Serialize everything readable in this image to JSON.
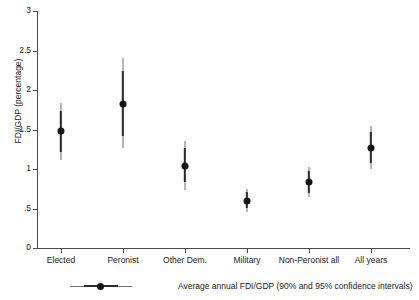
{
  "chart_data": {
    "type": "scatter",
    "title": "",
    "subtitle": "",
    "xlabel": "",
    "ylabel": "FDI/GDP (percentage)",
    "ylim": [
      0,
      3
    ],
    "yticks": [
      0,
      0.5,
      1,
      1.5,
      2,
      2.5,
      3
    ],
    "ytick_labels": [
      "0",
      ".5",
      "1",
      "1.5",
      "2",
      "2.5",
      "3"
    ],
    "grid": false,
    "legend_position": "below-axis",
    "legend_entries": [
      "Average annual FDI/GDP (90% and 95% confidence intervals)"
    ],
    "categories": [
      "Elected",
      "Peronist",
      "Other Dem.",
      "Military",
      "Non-Peronist all",
      "All years"
    ],
    "values": [
      1.48,
      1.82,
      1.04,
      0.6,
      0.83,
      1.27
    ],
    "ci90_low": [
      1.22,
      1.42,
      0.83,
      0.5,
      0.7,
      1.08
    ],
    "ci90_high": [
      1.74,
      2.24,
      1.27,
      0.71,
      0.97,
      1.47
    ],
    "ci95_low": [
      1.12,
      1.26,
      0.74,
      0.46,
      0.64,
      1.0
    ],
    "ci95_high": [
      1.83,
      2.4,
      1.36,
      0.75,
      1.03,
      1.54
    ],
    "series": [
      {
        "name": "Average annual FDI/GDP",
        "values": [
          1.48,
          1.82,
          1.04,
          0.6,
          0.83,
          1.27
        ]
      }
    ],
    "marker_color": "#141414",
    "ci90_color": "#2b2b2b",
    "ci95_color": "#6f6f6f",
    "axis_color": "#4a4a4a",
    "background_color": "#ffffff"
  },
  "legend": {
    "label": "Average annual FDI/GDP (90% and 95% confidence intervals)"
  }
}
